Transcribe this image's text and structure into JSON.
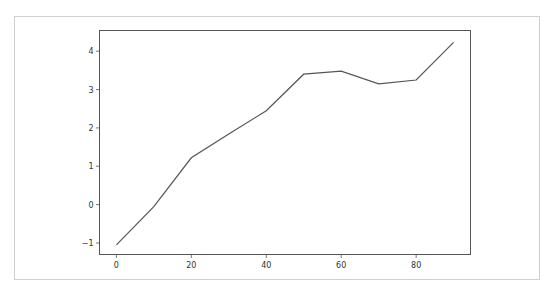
{
  "chart_data": {
    "type": "line",
    "title": "",
    "xlabel": "",
    "ylabel": "",
    "x": [
      0,
      10,
      20,
      30,
      40,
      50,
      60,
      70,
      80,
      90
    ],
    "series": [
      {
        "name": "",
        "values": [
          -1.05,
          -0.05,
          1.22,
          1.84,
          2.45,
          3.4,
          3.48,
          3.15,
          3.25,
          4.23
        ],
        "color": "#555555"
      }
    ],
    "xticks": [
      0,
      20,
      40,
      60,
      80
    ],
    "yticks": [
      -1,
      0,
      1,
      2,
      3,
      4
    ],
    "xlim": [
      -4.5,
      94.5
    ],
    "ylim": [
      -1.3,
      4.54
    ],
    "grid": false,
    "legend": null
  },
  "labels": {
    "xticks": [
      "0",
      "20",
      "40",
      "60",
      "80"
    ],
    "yticks": [
      "−1",
      "0",
      "1",
      "2",
      "3",
      "4"
    ]
  }
}
